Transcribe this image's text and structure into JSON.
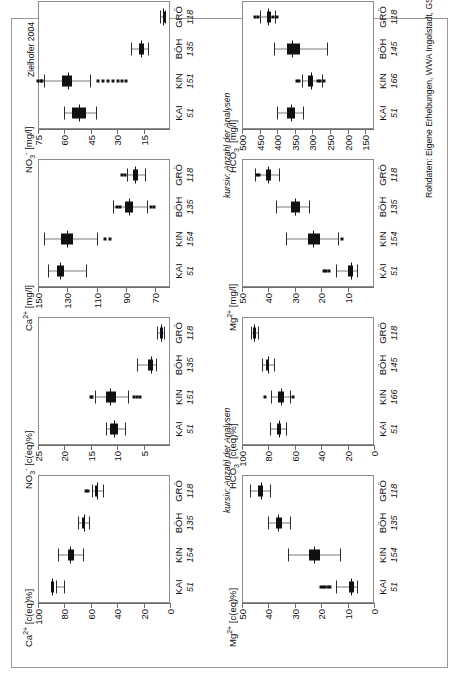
{
  "figure": {
    "credit": "Zielhofer 2004",
    "source_note": "Rohdaten: Eigene Erhebungen, WWA Ingolstadt, GSF",
    "italic_note": "kursiv: Anzahl der Analysen",
    "colors": {
      "ink": "#111111",
      "frame": "#8d8d8d",
      "whisker": "#7a7a7a",
      "sheet": "#9a9a9a"
    }
  },
  "chart_data": [
    {
      "id": "ca-eq",
      "type": "box",
      "title": "Ca",
      "title_sup": "2+",
      "title_unit": "[c(eq)%]",
      "ylabel": "Ca2+ [c(eq)%]",
      "ylim": [
        0,
        100
      ],
      "yticks": [
        100,
        80,
        60,
        40,
        20,
        0
      ],
      "categories": [
        "KAI",
        "KIN",
        "BÖH",
        "GRÖ"
      ],
      "counts": [
        51,
        154,
        135,
        118
      ],
      "boxes": [
        {
          "low": 86,
          "q1": 88.5,
          "median": 89.5,
          "q3": 90.5,
          "high": 80.5,
          "outliers": []
        },
        {
          "low": 85,
          "q1": 77.5,
          "median": 75.5,
          "q3": 72.5,
          "high": 66,
          "outliers": []
        },
        {
          "low": 70,
          "q1": 66.5,
          "median": 65.5,
          "q3": 64.5,
          "high": 61,
          "outliers": []
        },
        {
          "low": 59,
          "q1": 56.5,
          "median": 55.5,
          "q3": 54.5,
          "high": 50.5,
          "outliers": [
            62,
            63.5
          ]
        }
      ]
    },
    {
      "id": "no3-eq",
      "type": "box",
      "title": "NO",
      "title_sub": "3",
      "title_sup": "-",
      "title_unit": "[c(eq)%]",
      "ylabel": "NO3- [c(eq)%]",
      "ylim": [
        0,
        25
      ],
      "yticks": [
        25,
        20,
        15,
        10,
        5
      ],
      "categories": [
        "KAI",
        "KIN",
        "BÖH",
        "GRÖ"
      ],
      "counts": [
        51,
        151,
        135,
        118
      ],
      "boxes": [
        {
          "low": 12.1,
          "q1": 11.3,
          "median": 10.6,
          "q3": 9.9,
          "high": 8.5,
          "outliers": []
        },
        {
          "low": 14.2,
          "q1": 12.1,
          "median": 11.3,
          "q3": 10.2,
          "high": 8.0,
          "outliers": [
            15.0,
            14.7,
            6.9,
            6.3,
            5.7
          ]
        },
        {
          "low": 6.2,
          "q1": 4.1,
          "median": 3.6,
          "q3": 3.2,
          "high": 2.6,
          "outliers": []
        },
        {
          "low": 2.4,
          "q1": 1.9,
          "median": 1.7,
          "q3": 1.5,
          "high": 1.2,
          "outliers": []
        }
      ]
    },
    {
      "id": "mg-eq",
      "type": "box",
      "title": "Mg",
      "title_sup": "2+",
      "title_unit": "[c(eq)%]",
      "ylabel": "Mg2+ [c(eq)%]",
      "ylim": [
        0,
        50
      ],
      "yticks": [
        50,
        40,
        30,
        20,
        10,
        0
      ],
      "categories": [
        "KAI",
        "KIN",
        "BÖH",
        "GRÖ"
      ],
      "counts": [
        51,
        154,
        135,
        118
      ],
      "boxes": [
        {
          "low": 14.5,
          "q1": 9.5,
          "median": 8.6,
          "q3": 7.6,
          "high": 6.4,
          "outliers": [
            20.0,
            19.2,
            18.4,
            17.6,
            16.8
          ]
        },
        {
          "low": 32.5,
          "q1": 24.5,
          "median": 22.8,
          "q3": 20.3,
          "high": 13.0,
          "outliers": []
        },
        {
          "low": 40.0,
          "q1": 37.2,
          "median": 36.3,
          "q3": 34.8,
          "high": 32.0,
          "outliers": []
        },
        {
          "low": 47.0,
          "q1": 43.8,
          "median": 42.8,
          "q3": 41.9,
          "high": 39.5,
          "outliers": []
        }
      ]
    },
    {
      "id": "hco3-eq",
      "type": "box",
      "title": "HCO",
      "title_sub": "3",
      "title_sup": "-",
      "title_unit": "[c(eq)%]",
      "ylabel": "HCO3- [c(eq)%]",
      "ylim": [
        0,
        100
      ],
      "yticks": [
        100,
        80,
        60,
        40,
        20,
        0
      ],
      "categories": [
        "KAI",
        "KIN",
        "BÖH",
        "GRÖ"
      ],
      "counts": [
        51,
        166,
        145,
        118
      ],
      "boxes": [
        {
          "low": 78.5,
          "q1": 73.5,
          "median": 72.0,
          "q3": 70.5,
          "high": 66.5,
          "outliers": []
        },
        {
          "low": 78.0,
          "q1": 72.5,
          "median": 70.5,
          "q3": 68.0,
          "high": 63.5,
          "outliers": [
            82.5,
            61.5
          ]
        },
        {
          "low": 85.0,
          "q1": 81.5,
          "median": 80.5,
          "q3": 79.5,
          "high": 76.0,
          "outliers": []
        },
        {
          "low": 93.0,
          "q1": 91.5,
          "median": 90.8,
          "q3": 90.0,
          "high": 88.0,
          "outliers": []
        }
      ]
    },
    {
      "id": "ca-mgl",
      "type": "box",
      "title": "Ca",
      "title_sup": "2+",
      "title_unit": "[mg/l]",
      "ylabel": "Ca2+ [mg/l]",
      "ylim": [
        60,
        150
      ],
      "yticks": [
        150,
        130,
        110,
        90,
        70
      ],
      "categories": [
        "KAI",
        "KIN",
        "BÖH",
        "GRÖ"
      ],
      "counts": [
        51,
        154,
        135,
        118
      ],
      "boxes": [
        {
          "low": 143,
          "q1": 137,
          "median": 135,
          "q3": 132,
          "high": 117,
          "outliers": []
        },
        {
          "low": 146,
          "q1": 134,
          "median": 130,
          "q3": 126,
          "high": 110,
          "outliers": [
            104,
            101
          ]
        },
        {
          "low": 99,
          "q1": 91,
          "median": 88,
          "q3": 85,
          "high": 76,
          "outliers": [
            96,
            94,
            73,
            71
          ]
        },
        {
          "low": 89,
          "q1": 85,
          "median": 84,
          "q3": 82,
          "high": 77,
          "outliers": [
            93,
            91
          ]
        }
      ]
    },
    {
      "id": "no3-mgl",
      "type": "box",
      "title": "NO",
      "title_sub": "3",
      "title_sup": "-",
      "title_unit": "[mg/l]",
      "ylabel": "NO3- [mg/l]",
      "ylim": [
        0,
        75
      ],
      "yticks": [
        75,
        60,
        45,
        30,
        15
      ],
      "categories": [
        "KAI",
        "KIN",
        "BÖH",
        "GRÖ"
      ],
      "counts": [
        51,
        151,
        135,
        118
      ],
      "boxes": [
        {
          "low": 60.5,
          "q1": 55.5,
          "median": 51.5,
          "q3": 47.5,
          "high": 42.0,
          "outliers": []
        },
        {
          "low": 71.5,
          "q1": 61.5,
          "median": 58.0,
          "q3": 55.5,
          "high": 45.5,
          "outliers": [
            75.0,
            73.5,
            72.5,
            41.0,
            38.0,
            35.5,
            32.5,
            29.5,
            27.0,
            25.0
          ]
        },
        {
          "low": 22.0,
          "q1": 17.5,
          "median": 16.5,
          "q3": 14.5,
          "high": 12.5,
          "outliers": []
        },
        {
          "low": 5.5,
          "q1": 4.2,
          "median": 3.8,
          "q3": 3.4,
          "high": 2.8,
          "outliers": []
        }
      ]
    },
    {
      "id": "mg-mgl",
      "type": "box",
      "title": "Mg",
      "title_sup": "2+",
      "title_unit": "[mg/l]",
      "ylabel": "Mg2+ [mg/l]",
      "ylim": [
        0,
        50
      ],
      "yticks": [
        50,
        40,
        30,
        20,
        10
      ],
      "categories": [
        "KAI",
        "KIN",
        "BÖH",
        "GRÖ"
      ],
      "counts": [
        51,
        154,
        135,
        118
      ],
      "boxes": [
        {
          "low": 14.5,
          "q1": 9.8,
          "median": 8.8,
          "q3": 7.8,
          "high": 6.5,
          "outliers": [
            19.0,
            18.0,
            17.0
          ]
        },
        {
          "low": 33.5,
          "q1": 25.0,
          "median": 23.0,
          "q3": 20.5,
          "high": 13.5,
          "outliers": [
            12.0
          ]
        },
        {
          "low": 37.0,
          "q1": 31.5,
          "median": 30.0,
          "q3": 28.0,
          "high": 24.5,
          "outliers": []
        },
        {
          "low": 45.0,
          "q1": 41.0,
          "median": 40.0,
          "q3": 39.0,
          "high": 36.0,
          "outliers": [
            44.5,
            43.5
          ]
        }
      ]
    },
    {
      "id": "hco3-mgl",
      "type": "box",
      "title": "HCO",
      "title_sub": "3",
      "title_sup": "-",
      "title_unit": "[mg/l]",
      "ylabel": "HCO3- [mg/l]",
      "ylim": [
        125,
        500
      ],
      "yticks": [
        500,
        450,
        400,
        350,
        300,
        250,
        200,
        150
      ],
      "categories": [
        "KAI",
        "KIN",
        "BÖH",
        "GRÖ"
      ],
      "counts": [
        51,
        166,
        145,
        118
      ],
      "boxes": [
        {
          "low": 400,
          "q1": 372,
          "median": 362,
          "q3": 350,
          "high": 328,
          "outliers": []
        },
        {
          "low": 330,
          "q1": 312,
          "median": 305,
          "q3": 298,
          "high": 272,
          "outliers": [
            345,
            338,
            285,
            278,
            268
          ]
        },
        {
          "low": 410,
          "q1": 372,
          "median": 358,
          "q3": 335,
          "high": 258,
          "outliers": []
        },
        {
          "low": 448,
          "q1": 430,
          "median": 425,
          "q3": 418,
          "high": 405,
          "outliers": [
            462,
            455,
            412,
            400
          ]
        }
      ]
    }
  ]
}
